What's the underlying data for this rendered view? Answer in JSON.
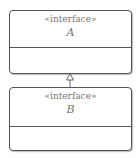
{
  "diagram": {
    "type": "uml-class-diagram",
    "classes": [
      {
        "stereotype": "«interface»",
        "name": "A"
      },
      {
        "stereotype": "«interface»",
        "name": "B"
      }
    ],
    "relations": [
      {
        "from": "B",
        "to": "A",
        "kind": "generalization"
      }
    ]
  }
}
